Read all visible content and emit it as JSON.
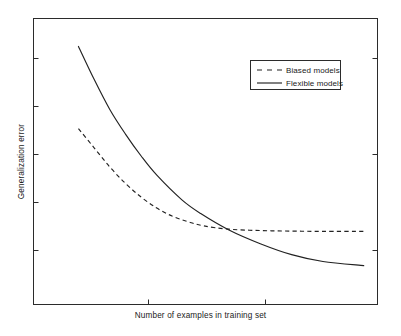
{
  "chart_data": {
    "type": "line",
    "title": "",
    "xlabel": "Number of examples in training set",
    "ylabel": "Generalization error",
    "grid": false,
    "legend_position": "upper right",
    "axis": {
      "x_ticks_labeled": false,
      "y_ticks_labeled": false,
      "x_tick_count": 2,
      "y_tick_count": 5,
      "xlim": [
        0,
        1
      ],
      "ylim": [
        0,
        1
      ]
    },
    "series": [
      {
        "name": "Biased models",
        "style": "dashed",
        "color": "#222222",
        "description": "Error falls quickly then flattens to a non-zero asymptote (bias floor).",
        "x": [
          0.07,
          0.12,
          0.17,
          0.22,
          0.27,
          0.32,
          0.37,
          0.42,
          0.47,
          0.55,
          0.65,
          0.75,
          0.85,
          0.98
        ],
        "y": [
          0.62,
          0.55,
          0.48,
          0.42,
          0.37,
          0.33,
          0.3,
          0.28,
          0.265,
          0.253,
          0.248,
          0.246,
          0.245,
          0.245
        ]
      },
      {
        "name": "Flexible models",
        "style": "solid",
        "color": "#222222",
        "description": "Error starts much higher, decays steadily and continues toward zero, crossing the biased curve.",
        "x": [
          0.07,
          0.12,
          0.17,
          0.22,
          0.27,
          0.32,
          0.4,
          0.46,
          0.55,
          0.65,
          0.75,
          0.85,
          0.98
        ],
        "y": [
          0.92,
          0.8,
          0.69,
          0.6,
          0.52,
          0.45,
          0.36,
          0.31,
          0.25,
          0.2,
          0.16,
          0.135,
          0.12
        ]
      }
    ],
    "crossover": {
      "x": 0.46,
      "y": 0.26
    }
  },
  "figure": {
    "x_axis_label": "Number of examples in training set",
    "y_axis_label": "Generalization error"
  },
  "legend": {
    "entries": [
      {
        "label": "Biased models",
        "style": "dashed"
      },
      {
        "label": "Flexible models",
        "style": "solid"
      }
    ]
  }
}
